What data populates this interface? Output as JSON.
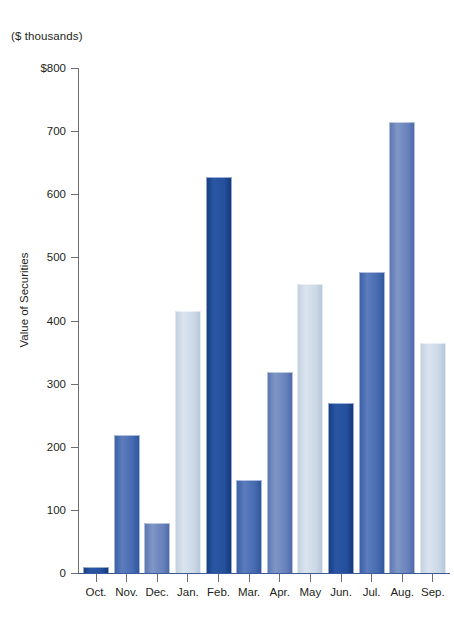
{
  "chart_data": {
    "type": "bar",
    "title": "",
    "units_caption": "($ thousands)",
    "xlabel": "",
    "ylabel": "Value of Securities",
    "ylim": [
      0,
      800
    ],
    "ytick_values": [
      800,
      700,
      600,
      500,
      400,
      300,
      200,
      100,
      0
    ],
    "ytick_labels": [
      "$800",
      "700",
      "600",
      "500",
      "400",
      "300",
      "200",
      "100",
      "0"
    ],
    "grid": false,
    "legend": null,
    "categories": [
      "Oct.",
      "Nov.",
      "Dec.",
      "Jan.",
      "Feb.",
      "Mar.",
      "Apr.",
      "May",
      "Jun.",
      "Jul.",
      "Aug.",
      "Sep."
    ],
    "values": [
      10,
      219,
      79,
      415,
      627,
      148,
      319,
      458,
      269,
      477,
      714,
      365
    ],
    "bar_styles": [
      "dark",
      "steel",
      "mid",
      "light",
      "dark",
      "steel",
      "mid",
      "light",
      "dark",
      "steel",
      "mid",
      "light"
    ],
    "colors": {
      "dark_navy": "#1f4b9b",
      "steel_blue": "#456cae",
      "mid_slate": "#6782bc",
      "light_blue": "#c9d6e4",
      "axis": "#6d6e71",
      "baseline": "#3a5a9b",
      "text": "#231f20",
      "background": "#ffffff"
    }
  }
}
